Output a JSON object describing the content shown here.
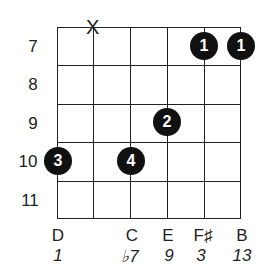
{
  "diagram": {
    "type": "guitar-chord-chart",
    "strings": 6,
    "frets": [
      {
        "label": "7"
      },
      {
        "label": "8"
      },
      {
        "label": "9"
      },
      {
        "label": "10"
      },
      {
        "label": "11"
      }
    ],
    "muted_strings": [
      {
        "string": 2,
        "symbol": "X"
      }
    ],
    "fingerings": [
      {
        "string": 5,
        "fret": 7,
        "finger": "1"
      },
      {
        "string": 6,
        "fret": 7,
        "finger": "1"
      },
      {
        "string": 4,
        "fret": 9,
        "finger": "2"
      },
      {
        "string": 1,
        "fret": 10,
        "finger": "3"
      },
      {
        "string": 3,
        "fret": 10,
        "finger": "4"
      }
    ],
    "notes": [
      {
        "string": 1,
        "note": "D",
        "interval": "1"
      },
      {
        "string": 3,
        "note": "C",
        "interval": "♭7"
      },
      {
        "string": 4,
        "note": "E",
        "interval": "9"
      },
      {
        "string": 5,
        "note": "F♯",
        "interval": "3"
      },
      {
        "string": 6,
        "note": "B",
        "interval": "13"
      }
    ]
  }
}
